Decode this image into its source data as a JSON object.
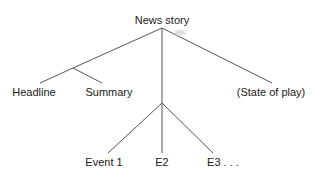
{
  "diagram": {
    "type": "tree",
    "colors": {
      "line": "#555555",
      "text": "#1a1a1a",
      "background": "#ffffff"
    },
    "nodes": {
      "root": {
        "label": "News story"
      },
      "headline": {
        "label": "Headline"
      },
      "summary": {
        "label": "Summary"
      },
      "state": {
        "label": "(State of play)"
      },
      "event1": {
        "label": "Event 1"
      },
      "e2": {
        "label": "E2"
      },
      "e3": {
        "label": "E3 . . ."
      }
    },
    "edges": [
      {
        "from": "root",
        "to": "headline-summary-junction"
      },
      {
        "from": "headline-summary-junction",
        "to": "headline"
      },
      {
        "from": "headline-summary-junction",
        "to": "summary"
      },
      {
        "from": "root",
        "to": "events-junction"
      },
      {
        "from": "events-junction",
        "to": "event1"
      },
      {
        "from": "events-junction",
        "to": "e2"
      },
      {
        "from": "events-junction",
        "to": "e3"
      },
      {
        "from": "root",
        "to": "state"
      }
    ]
  }
}
